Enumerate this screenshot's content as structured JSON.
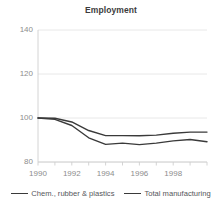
{
  "chart_data": {
    "type": "line",
    "title": "Employment",
    "xlabel": "",
    "ylabel": "",
    "x": [
      1990,
      1991,
      1992,
      1993,
      1994,
      1995,
      1996,
      1997,
      1998,
      1999,
      2000
    ],
    "xlim": [
      1990,
      2000
    ],
    "ylim": [
      80,
      140
    ],
    "xtick_labels": [
      "1990",
      "1992",
      "1994",
      "1996",
      "1998"
    ],
    "xticks": [
      1990,
      1992,
      1994,
      1996,
      1998
    ],
    "ytick_labels": [
      "140",
      "120",
      "100",
      "80"
    ],
    "yticks": [
      140,
      120,
      100,
      80
    ],
    "grid": "horizontal",
    "legend_position": "bottom",
    "series": [
      {
        "name": "Chem., rubber & plastics",
        "color": "#3a3a3a",
        "values": [
          100,
          99.9,
          98.2,
          94.3,
          92.0,
          92.0,
          91.9,
          92.2,
          93.1,
          93.6,
          93.6
        ]
      },
      {
        "name": "Total manufacturing",
        "color": "#3a3a3a",
        "values": [
          100,
          99.4,
          96.6,
          91.0,
          88.0,
          88.6,
          87.9,
          88.6,
          89.6,
          90.2,
          89.2
        ]
      }
    ]
  }
}
